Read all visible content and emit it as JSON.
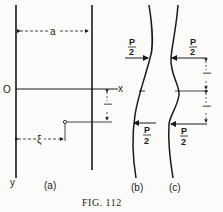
{
  "figure": {
    "caption": "FIG. 112",
    "panels": {
      "a": {
        "label": "(a)",
        "width_label": "a",
        "origin_label": "O",
        "x_axis_label": "x",
        "y_axis_label": "y",
        "xi_label": "ξ",
        "eta_label": "l"
      },
      "b": {
        "label": "(b)",
        "force_top": {
          "num": "P",
          "den": "2"
        },
        "force_bottom": {
          "num": "P",
          "den": "2"
        }
      },
      "c": {
        "label": "(c)",
        "force_top": {
          "num": "P",
          "den": "2"
        },
        "force_bottom": {
          "num": "P",
          "den": "2"
        },
        "dim_label_upper": "l",
        "dim_label_lower": "l"
      }
    }
  }
}
